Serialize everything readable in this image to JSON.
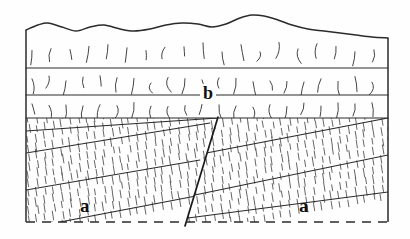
{
  "figure": {
    "kind": "geologic-cross-section",
    "title": "",
    "background_color": "#fefefe",
    "line_color": "#2b2b2b",
    "hatch_color": "#555555",
    "text_color": "#111111"
  },
  "labels": {
    "a_left": "a",
    "a_right": "a",
    "b": "b"
  },
  "frame": {
    "left_x": 26,
    "right_x": 388,
    "top_y": 30,
    "bottom_y": 222,
    "bottom_style": "dashed",
    "side_style": "solid"
  },
  "chart_data": {
    "type": "line",
    "title": "",
    "xlabel": "",
    "ylabel": "",
    "grid": false,
    "legend": "none",
    "xlim": [
      26,
      388
    ],
    "ylim": [
      239,
      0
    ],
    "series": [
      {
        "name": "topographic-erosion-surface",
        "kind": "wavy-ground-surface",
        "x": [
          26,
          38,
          48,
          62,
          76,
          90,
          104,
          120,
          134,
          150,
          166,
          182,
          198,
          212,
          226,
          240,
          252,
          264,
          278,
          292,
          308,
          324,
          340,
          356,
          372,
          388
        ],
        "y": [
          30,
          25,
          23,
          27,
          31,
          27,
          25,
          29,
          31,
          29,
          25,
          23,
          24,
          27,
          24,
          18,
          15,
          16,
          20,
          25,
          29,
          31,
          33,
          35,
          37,
          38
        ]
      },
      {
        "name": "bedding-contact-1",
        "kind": "horizontal-layer-boundary",
        "x": [
          26,
          388
        ],
        "y": [
          68,
          68
        ]
      },
      {
        "name": "bedding-contact-2",
        "kind": "horizontal-layer-boundary",
        "x": [
          26,
          388
        ],
        "y": [
          95,
          95
        ]
      },
      {
        "name": "unconformity-contact",
        "kind": "horizontal-layer-boundary",
        "x": [
          26,
          388
        ],
        "y": [
          118,
          118
        ]
      },
      {
        "name": "fault-plane",
        "kind": "normal-fault",
        "x": [
          218,
          185
        ],
        "y": [
          117,
          226
        ]
      },
      {
        "name": "left-block-bed-1",
        "kind": "dipping-bed",
        "x": [
          26,
          218
        ],
        "y": [
          131,
          118
        ]
      },
      {
        "name": "left-block-bed-2",
        "kind": "dipping-bed",
        "x": [
          26,
          210
        ],
        "y": [
          153,
          123
        ]
      },
      {
        "name": "left-block-bed-3",
        "kind": "dipping-bed",
        "x": [
          26,
          200
        ],
        "y": [
          190,
          160
        ]
      },
      {
        "name": "left-block-bed-4",
        "kind": "dipping-bed",
        "x": [
          60,
          196
        ],
        "y": [
          222,
          196
        ]
      },
      {
        "name": "right-block-bed-1",
        "kind": "dipping-bed",
        "x": [
          196,
          388
        ],
        "y": [
          155,
          118
        ]
      },
      {
        "name": "right-block-bed-2",
        "kind": "dipping-bed",
        "x": [
          190,
          388
        ],
        "y": [
          196,
          155
        ]
      },
      {
        "name": "right-block-bed-3",
        "kind": "dipping-bed",
        "x": [
          188,
          388
        ],
        "y": [
          218,
          192
        ]
      }
    ],
    "annotations": [
      {
        "text": "a",
        "x": 88,
        "y": 209,
        "note": "lower dipping hatched unit, left fault block"
      },
      {
        "text": "a",
        "x": 307,
        "y": 209,
        "note": "lower dipping hatched unit, right fault block"
      },
      {
        "text": "b",
        "x": 208,
        "y": 95,
        "note": "upper horizontally bedded sequence"
      }
    ],
    "units": [
      {
        "label": "b",
        "description": "upper horizontal stratified beds with short tick ornament",
        "count_of_beds": 3
      },
      {
        "label": "a",
        "description": "lower dipping hatched (schistose) beds cut by fault",
        "count_of_beds": 4
      }
    ]
  }
}
